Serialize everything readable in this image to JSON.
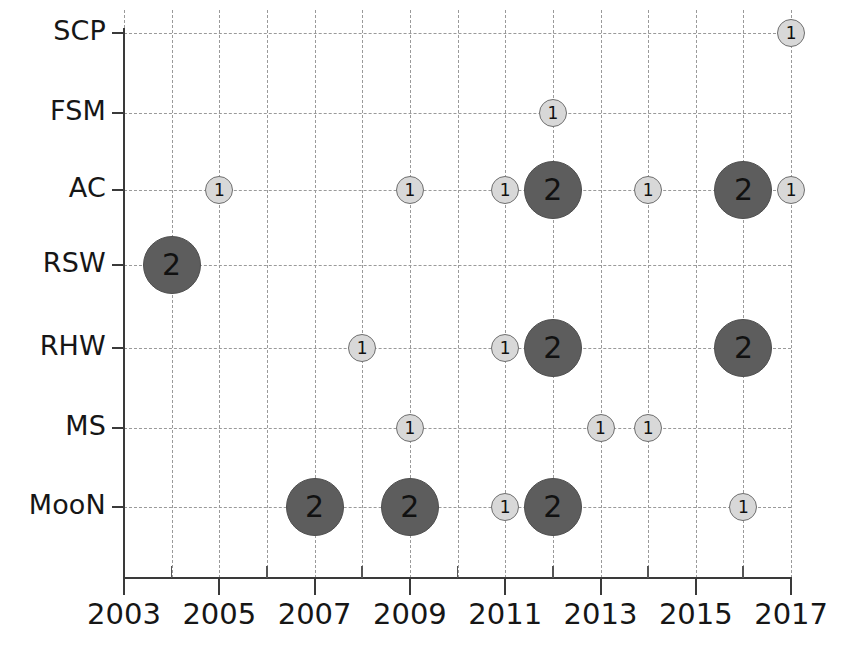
{
  "chart_data": {
    "type": "scatter",
    "title": "",
    "subtitle": "",
    "xlabel": "",
    "ylabel": "",
    "grid": true,
    "legend": "none",
    "xlim": [
      2003,
      2017
    ],
    "x_tick_labels": [
      "2003",
      "2005",
      "2007",
      "2009",
      "2011",
      "2013",
      "2015",
      "2017"
    ],
    "x_tick_values": [
      2003,
      2005,
      2007,
      2009,
      2011,
      2013,
      2015,
      2017
    ],
    "x_minor_tick_values": [
      2004,
      2006,
      2008,
      2010,
      2012,
      2014,
      2016
    ],
    "categories": [
      "MooN",
      "MS",
      "RHW",
      "RSW",
      "AC",
      "FSM",
      "SCP"
    ],
    "y_tick_labels": [
      "SCP",
      "FSM",
      "AC",
      "RSW",
      "RHW",
      "MS",
      "MooN"
    ],
    "bubble_value_labels": [
      "1",
      "2"
    ],
    "colors": {
      "bubble_small_fill": "#d8d8d8",
      "bubble_small_border": "#6f6f6f",
      "bubble_large_fill": "#5d5d5d",
      "bubble_large_border": "#4f4f4f",
      "grid": "#9a9a9a",
      "axis": "#3a3a3a",
      "text": "#161616"
    },
    "points": [
      {
        "category": "SCP",
        "x": 2017,
        "value": 1
      },
      {
        "category": "FSM",
        "x": 2012,
        "value": 1
      },
      {
        "category": "AC",
        "x": 2005,
        "value": 1
      },
      {
        "category": "AC",
        "x": 2009,
        "value": 1
      },
      {
        "category": "AC",
        "x": 2011,
        "value": 1
      },
      {
        "category": "AC",
        "x": 2012,
        "value": 2
      },
      {
        "category": "AC",
        "x": 2014,
        "value": 1
      },
      {
        "category": "AC",
        "x": 2016,
        "value": 2
      },
      {
        "category": "AC",
        "x": 2017,
        "value": 1
      },
      {
        "category": "RSW",
        "x": 2004,
        "value": 2
      },
      {
        "category": "RHW",
        "x": 2008,
        "value": 1
      },
      {
        "category": "RHW",
        "x": 2011,
        "value": 1
      },
      {
        "category": "RHW",
        "x": 2012,
        "value": 2
      },
      {
        "category": "RHW",
        "x": 2016,
        "value": 2
      },
      {
        "category": "MS",
        "x": 2009,
        "value": 1
      },
      {
        "category": "MS",
        "x": 2013,
        "value": 1
      },
      {
        "category": "MS",
        "x": 2014,
        "value": 1
      },
      {
        "category": "MooN",
        "x": 2007,
        "value": 2
      },
      {
        "category": "MooN",
        "x": 2009,
        "value": 2
      },
      {
        "category": "MooN",
        "x": 2011,
        "value": 1
      },
      {
        "category": "MooN",
        "x": 2012,
        "value": 2
      },
      {
        "category": "MooN",
        "x": 2016,
        "value": 1
      }
    ]
  },
  "layout": {
    "row_y": {
      "SCP": 33,
      "FSM": 113,
      "AC": 190,
      "RSW": 265,
      "RHW": 348,
      "MS": 428,
      "MooN": 507
    },
    "x_origin_px": 124,
    "px_per_year": 47.65,
    "plot_top_px": 10,
    "plot_bottom_px": 578
  }
}
